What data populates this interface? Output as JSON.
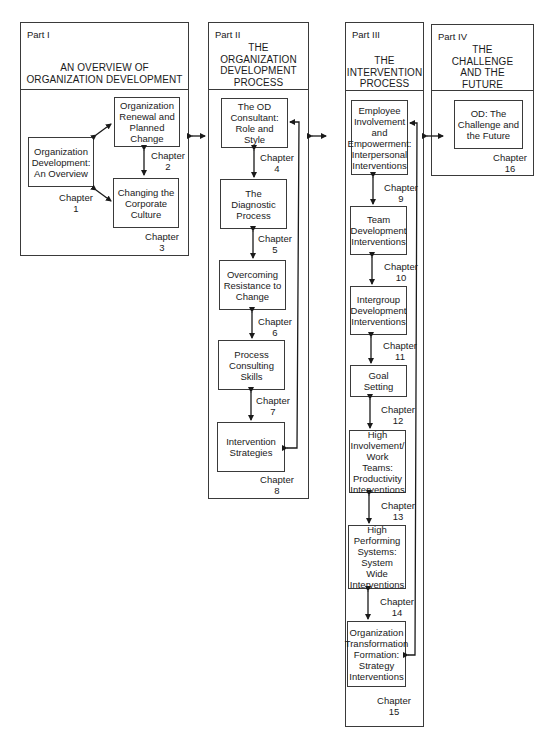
{
  "parts": [
    {
      "label": "Part I",
      "title_lines": [
        "AN OVERVIEW OF",
        "ORGANIZATION DEVELOPMENT"
      ],
      "chapters": [
        {
          "title": "Organization Development: An Overview",
          "chapter_label": "Chapter",
          "chapter_number": "1"
        },
        {
          "title": "Organization Renewal and Planned Change",
          "chapter_label": "Chapter",
          "chapter_number": "2"
        },
        {
          "title": "Changing the Corporate Culture",
          "chapter_label": "Chapter",
          "chapter_number": "3"
        }
      ]
    },
    {
      "label": "Part II",
      "title_lines": [
        "THE",
        "ORGANIZATION",
        "DEVELOPMENT",
        "PROCESS"
      ],
      "chapters": [
        {
          "title": "The OD Consultant: Role and Style",
          "chapter_label": "Chapter",
          "chapter_number": "4"
        },
        {
          "title": "The Diagnostic Process",
          "chapter_label": "Chapter",
          "chapter_number": "5"
        },
        {
          "title": "Overcoming Resistance to Change",
          "chapter_label": "Chapter",
          "chapter_number": "6"
        },
        {
          "title": "Process Consulting Skills",
          "chapter_label": "Chapter",
          "chapter_number": "7"
        },
        {
          "title": "Intervention Strategies",
          "chapter_label": "Chapter",
          "chapter_number": "8"
        }
      ]
    },
    {
      "label": "Part III",
      "title_lines": [
        "THE",
        "INTERVENTION",
        "PROCESS"
      ],
      "chapters": [
        {
          "title": "Employee Involvement and Empowerment: Interpersonal Interventions",
          "chapter_label": "Chapter",
          "chapter_number": "9"
        },
        {
          "title": "Team Development Interventions",
          "chapter_label": "Chapter",
          "chapter_number": "10"
        },
        {
          "title": "Intergroup Development Interventions",
          "chapter_label": "Chapter",
          "chapter_number": "11"
        },
        {
          "title": "Goal Setting",
          "chapter_label": "Chapter",
          "chapter_number": "12"
        },
        {
          "title": "High Involvement/ Work Teams: Productivity Interventions",
          "chapter_label": "Chapter",
          "chapter_number": "13"
        },
        {
          "title": "High Performing Systems: System Wide Interventions",
          "chapter_label": "Chapter",
          "chapter_number": "14"
        },
        {
          "title": "Organization Transformation Formation: Strategy Interventions",
          "chapter_label": "Chapter",
          "chapter_number": "15"
        }
      ]
    },
    {
      "label": "Part IV",
      "title_lines": [
        "THE",
        "CHALLENGE",
        "AND THE",
        "FUTURE"
      ],
      "chapters": [
        {
          "title": "OD: The Challenge and the Future",
          "chapter_label": "Chapter",
          "chapter_number": "16"
        }
      ]
    }
  ],
  "colors": {
    "line": "#3a3a3a",
    "text": "#1a1a1a",
    "background": "#ffffff"
  }
}
